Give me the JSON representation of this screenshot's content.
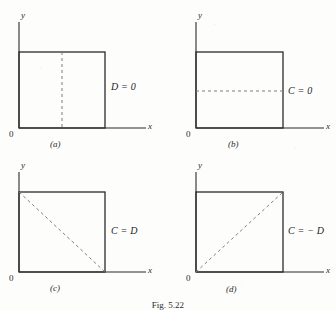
{
  "figure": {
    "caption": "Fig. 5.22",
    "background_color": "#fdfdfc",
    "line_color": "#2b2b2b",
    "dash_color": "#7d7d7d"
  },
  "panels": [
    {
      "id": "a",
      "caption": "(a)",
      "x_axis_label": "x",
      "y_axis_label": "y",
      "origin_label": "0",
      "boundary_label": "D = 0",
      "dash_type": "vertical-midline",
      "square": {
        "x0": 19,
        "y0": 52,
        "x1": 105,
        "y1": 128
      }
    },
    {
      "id": "b",
      "caption": "(b)",
      "x_axis_label": "x",
      "y_axis_label": "y",
      "origin_label": "0",
      "boundary_label": "C = 0",
      "dash_type": "horizontal-midline",
      "square": {
        "x0": 28,
        "y0": 52,
        "x1": 115,
        "y1": 128
      }
    },
    {
      "id": "c",
      "caption": "(c)",
      "x_axis_label": "x",
      "y_axis_label": "y",
      "origin_label": "0",
      "boundary_label": "C = D",
      "dash_type": "diagonal-tl-br",
      "square": {
        "x0": 19,
        "y0": 40,
        "x1": 105,
        "y1": 120
      }
    },
    {
      "id": "d",
      "caption": "(d)",
      "x_axis_label": "x",
      "y_axis_label": "y",
      "origin_label": "0",
      "boundary_label": "C = − D",
      "dash_type": "diagonal-bl-tr",
      "square": {
        "x0": 28,
        "y0": 40,
        "x1": 115,
        "y1": 120
      }
    }
  ]
}
